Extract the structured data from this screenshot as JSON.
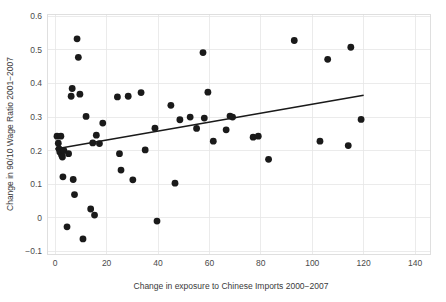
{
  "chart_data": {
    "type": "scatter",
    "title": "",
    "xlabel": "Change in exposure to Chinese Imports 2000−2007",
    "ylabel": "Change in 90/10 Wage Ratio 2001−2007",
    "xlim": [
      -3,
      146
    ],
    "ylim": [
      -0.108,
      0.607
    ],
    "xticks": [
      0,
      20,
      40,
      60,
      80,
      100,
      120,
      140
    ],
    "xtick_labels": [
      "0",
      "20",
      "40",
      "60",
      "80",
      "100",
      "120",
      "140"
    ],
    "yticks": [
      -0.1,
      0,
      0.1,
      0.2,
      0.3,
      0.4,
      0.5,
      0.6
    ],
    "ytick_labels": [
      "−0.1",
      "0",
      "0.1",
      "0.2",
      "0.3",
      "0.4",
      "0.5",
      "0.6"
    ],
    "grid": true,
    "legend": "none",
    "marker_color": "#1a1a1a",
    "marker_size": 3.4,
    "grid_color": "#e6e6e6",
    "frame_color": "#dcdcdc",
    "points": [
      [
        0.7,
        0.243
      ],
      [
        1.2,
        0.222
      ],
      [
        1.5,
        0.205
      ],
      [
        1.8,
        0.196
      ],
      [
        2.2,
        0.243
      ],
      [
        2.5,
        0.186
      ],
      [
        2.8,
        0.181
      ],
      [
        3.0,
        0.122
      ],
      [
        3.4,
        0.2
      ],
      [
        4.6,
        -0.027
      ],
      [
        5.2,
        0.191
      ],
      [
        6.2,
        0.362
      ],
      [
        6.6,
        0.385
      ],
      [
        7.0,
        0.114
      ],
      [
        7.5,
        0.069
      ],
      [
        8.5,
        0.533
      ],
      [
        9.0,
        0.478
      ],
      [
        9.6,
        0.368
      ],
      [
        10.8,
        -0.063
      ],
      [
        12.0,
        0.302
      ],
      [
        13.8,
        0.026
      ],
      [
        14.6,
        0.223
      ],
      [
        15.3,
        0.008
      ],
      [
        16.0,
        0.246
      ],
      [
        17.2,
        0.221
      ],
      [
        18.5,
        0.282
      ],
      [
        24.2,
        0.36
      ],
      [
        25.0,
        0.191
      ],
      [
        25.6,
        0.142
      ],
      [
        28.4,
        0.362
      ],
      [
        30.2,
        0.113
      ],
      [
        33.4,
        0.373
      ],
      [
        35.0,
        0.202
      ],
      [
        38.8,
        0.267
      ],
      [
        39.6,
        -0.01
      ],
      [
        45.0,
        0.335
      ],
      [
        46.6,
        0.103
      ],
      [
        48.5,
        0.292
      ],
      [
        52.5,
        0.3
      ],
      [
        55.0,
        0.266
      ],
      [
        57.5,
        0.492
      ],
      [
        58.0,
        0.297
      ],
      [
        59.4,
        0.374
      ],
      [
        61.5,
        0.228
      ],
      [
        66.5,
        0.262
      ],
      [
        68.0,
        0.303
      ],
      [
        69.0,
        0.3
      ],
      [
        77.0,
        0.24
      ],
      [
        79.0,
        0.243
      ],
      [
        83.0,
        0.174
      ],
      [
        93.0,
        0.528
      ],
      [
        103.0,
        0.228
      ],
      [
        106.0,
        0.472
      ],
      [
        114.0,
        0.215
      ],
      [
        115.0,
        0.508
      ],
      [
        119.0,
        0.293
      ]
    ],
    "fit_line": {
      "label": "linear fit",
      "x_start": 0,
      "x_end": 120,
      "y_start": 0.205,
      "y_end": 0.365,
      "color": "#1a1a1a"
    }
  },
  "axes": {
    "x_title": "Change in exposure to Chinese Imports 2000−2007",
    "y_title": "Change in 90/10 Wage Ratio 2001−2007"
  }
}
